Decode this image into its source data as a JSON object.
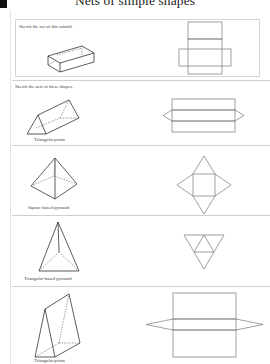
{
  "page": {
    "title": "Nets of simple shapes"
  },
  "sections": [
    {
      "instruction": "Sketch the net of this cuboid.",
      "shape": "cuboid",
      "caption": "",
      "net": "cuboid-net"
    },
    {
      "instruction": "Sketch the nets of these shapes.",
      "items": [
        {
          "shape": "triangular-prism",
          "caption": "Triangular prism",
          "net": "triangular-prism-net"
        },
        {
          "shape": "square-based-pyramid",
          "caption": "Square-based pyramid",
          "net": "square-pyramid-net"
        },
        {
          "shape": "triangular-based-pyramid",
          "caption": "Triangular-based pyramid",
          "net": "tetrahedron-net"
        },
        {
          "shape": "triangular-prism-upright",
          "caption": "Triangular prism",
          "net": "triangular-prism-net-2"
        }
      ]
    }
  ],
  "colors": {
    "text": "#333333",
    "rule": "#cfcfcf",
    "box_border": "#d6d6d6",
    "net_line": "#777777",
    "corner_mark": "#111111"
  }
}
